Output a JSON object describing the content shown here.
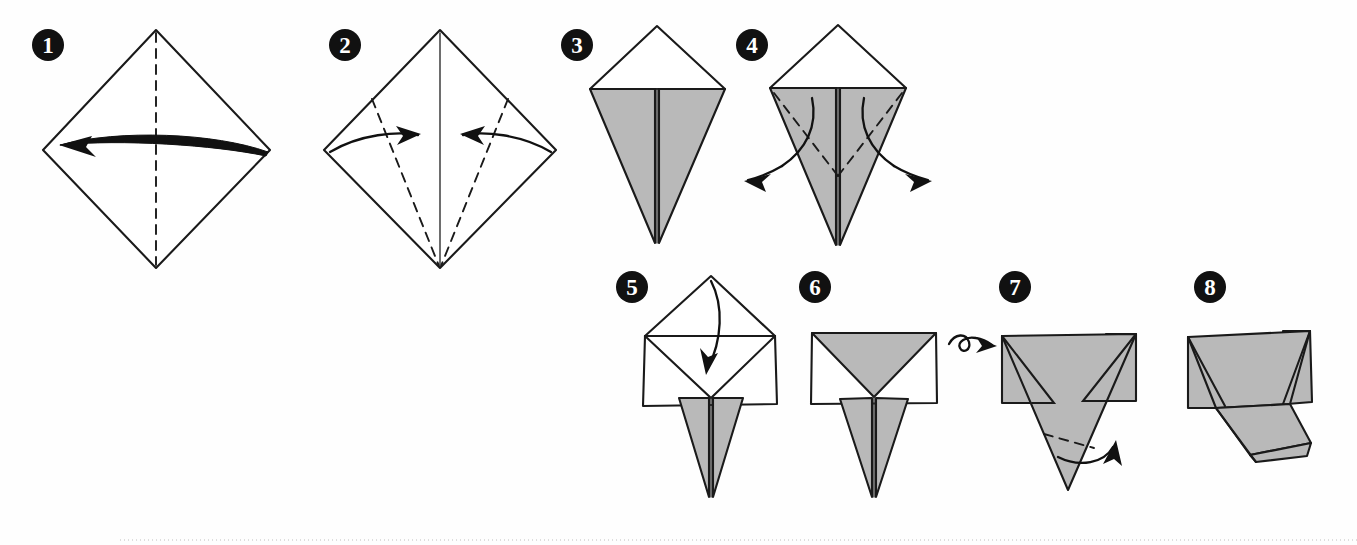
{
  "document": {
    "title": "Origami Folding Instructions",
    "type": "origami-fold-diagram",
    "step_count": 8,
    "background_color": "#ffffff",
    "paper_front_color": "#ffffff",
    "paper_back_color": "#b9b9b9",
    "line_color": "#1a1a1a"
  },
  "steps": [
    {
      "number": "1",
      "badge": {
        "x": 48,
        "y": 45
      },
      "shape": "diamond",
      "description": "Square sheet rotated 45 degrees with a vertical valley crease down the centre; curved arrow indicates folding the right half over to the left.",
      "creases": [
        "vertical-center-dashed"
      ],
      "arrows": [
        "long-horizontal-arrow-left"
      ]
    },
    {
      "number": "2",
      "badge": {
        "x": 345,
        "y": 45
      },
      "shape": "diamond",
      "description": "Unfolded diamond showing the vertical centre crease as a solid line, with two dashed diagonal fold lines running from the upper side edges down to the bottom vertex; two curved arrows point inward.",
      "creases": [
        "vertical-center-solid",
        "left-diagonal-dashed",
        "right-diagonal-dashed"
      ],
      "arrows": [
        "curved-arrow-right",
        "curved-arrow-left"
      ]
    },
    {
      "number": "3",
      "badge": {
        "x": 577,
        "y": 45
      },
      "shape": "kite",
      "description": "Kite base: white triangle above the shoulders, two shaded flaps below meeting at a centre seam and tapering to a point.",
      "creases": [
        "center-seam"
      ],
      "arrows": []
    },
    {
      "number": "4",
      "badge": {
        "x": 752,
        "y": 45
      },
      "shape": "kite-with-creases",
      "description": "Same kite with dashed diagonal creases running from the shoulders to the centre; two curved arrows point outward to the lower left and lower right.",
      "creases": [
        "left-shoulder-dashed",
        "right-shoulder-dashed"
      ],
      "arrows": [
        "curved-arrow-out-left",
        "curved-arrow-out-right"
      ]
    },
    {
      "number": "5",
      "badge": {
        "x": 632,
        "y": 287
      },
      "shape": "open-flaps",
      "description": "The flaps are swung out to form a wide white band; dashed horizontal crease at the shoulder line with a curved arrow showing the top triangle folding down. Shaded points hang below.",
      "creases": [
        "horizontal-dashed"
      ],
      "arrows": [
        "curved-arrow-down"
      ]
    },
    {
      "number": "6",
      "badge": {
        "x": 815,
        "y": 287
      },
      "shape": "folded-band",
      "description": "Top triangle folded down, giving a rectangle with a shaded inverted triangle inside and shaded points below. A turn-over symbol sits to the right.",
      "creases": [],
      "arrows": [
        "turn-over-symbol"
      ]
    },
    {
      "number": "7",
      "badge": {
        "x": 1015,
        "y": 287
      },
      "shape": "reversed",
      "description": "The model turned over, showing a shaded rectangle with a large inverted triangle below. A dashed crease across the lower point and a curved arrow show the tip folding up.",
      "creases": [
        "lower-point-dashed"
      ],
      "arrows": [
        "curved-arrow-up-right"
      ]
    },
    {
      "number": "8",
      "badge": {
        "x": 1210,
        "y": 287
      },
      "shape": "finished",
      "description": "Finished flattened form: a wide shaded trapezoid with a narrow folded flap projecting down to the right.",
      "creases": [],
      "arrows": []
    }
  ],
  "page": {
    "bottom_rule": true
  }
}
